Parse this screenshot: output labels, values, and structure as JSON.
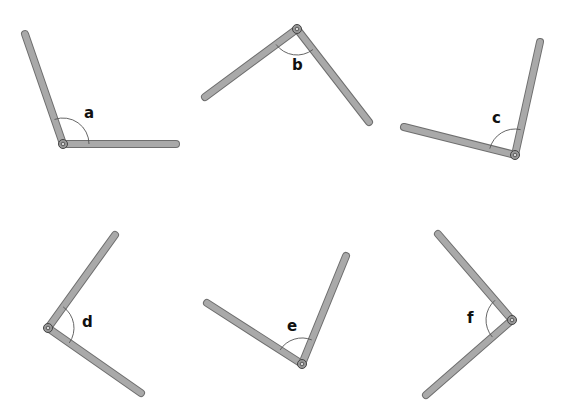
{
  "colors": {
    "rod": "#a9a9a9",
    "rod_outline": "#6e6e6e",
    "label": "#111111",
    "background": "#ffffff"
  },
  "angles": [
    {
      "label": "a",
      "pivot": [
        63,
        144
      ],
      "arm1": [
        25,
        34
      ],
      "arm2": [
        176,
        144
      ],
      "label_pos": [
        84,
        118
      ]
    },
    {
      "label": "b",
      "pivot": [
        297,
        29
      ],
      "arm1": [
        205,
        97
      ],
      "arm2": [
        369,
        122
      ],
      "label_pos": [
        292,
        70
      ]
    },
    {
      "label": "c",
      "pivot": [
        515,
        155
      ],
      "arm1": [
        404,
        127
      ],
      "arm2": [
        540,
        42
      ],
      "label_pos": [
        492,
        123
      ]
    },
    {
      "label": "d",
      "pivot": [
        48,
        328
      ],
      "arm1": [
        115,
        235
      ],
      "arm2": [
        141,
        393
      ],
      "label_pos": [
        82,
        327
      ]
    },
    {
      "label": "e",
      "pivot": [
        302,
        364
      ],
      "arm1": [
        207,
        303
      ],
      "arm2": [
        346,
        256
      ],
      "label_pos": [
        287,
        331
      ]
    },
    {
      "label": "f",
      "pivot": [
        512,
        320
      ],
      "arm1": [
        438,
        234
      ],
      "arm2": [
        426,
        395
      ],
      "label_pos": [
        467,
        323
      ]
    }
  ]
}
